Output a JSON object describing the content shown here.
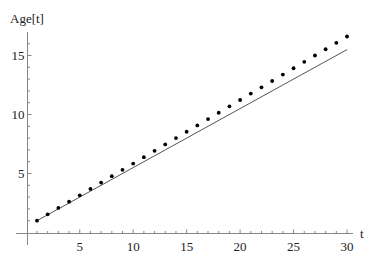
{
  "chart_data": {
    "type": "line",
    "title": "",
    "xlabel": "t",
    "ylabel": "Age[t]",
    "xlim": [
      0,
      30
    ],
    "ylim": [
      0,
      17
    ],
    "grid": false,
    "legend": null,
    "x_ticks": [
      5,
      10,
      15,
      20,
      25,
      30
    ],
    "y_ticks": [
      5,
      10,
      15
    ],
    "x_tick_labels": [
      "5",
      "10",
      "15",
      "20",
      "25",
      "30"
    ],
    "y_tick_labels": [
      "5",
      "10",
      "15"
    ],
    "series": [
      {
        "name": "points",
        "style": "scatter",
        "color": "#000000",
        "x": [
          1,
          2,
          3,
          4,
          5,
          6,
          7,
          8,
          9,
          10,
          11,
          12,
          13,
          14,
          15,
          16,
          17,
          18,
          19,
          20,
          21,
          22,
          23,
          24,
          25,
          26,
          27,
          28,
          29,
          30
        ],
        "values": [
          1.0,
          1.54,
          2.08,
          2.61,
          3.15,
          3.69,
          4.23,
          4.77,
          5.31,
          5.84,
          6.38,
          6.92,
          7.46,
          8.0,
          8.54,
          9.07,
          9.61,
          10.15,
          10.69,
          11.23,
          11.77,
          12.3,
          12.84,
          13.38,
          13.92,
          14.46,
          15.0,
          15.53,
          16.07,
          16.61
        ]
      },
      {
        "name": "line",
        "style": "line",
        "color": "#555555",
        "x": [
          1,
          30
        ],
        "values": [
          1.0,
          15.5
        ]
      }
    ]
  },
  "axes": {
    "x_label": "t",
    "y_label": "Age[t]"
  }
}
